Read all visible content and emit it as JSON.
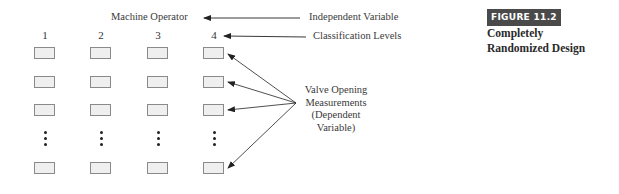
{
  "figure": {
    "badge": "FIGURE 11.2",
    "title_line1": "Completely",
    "title_line2": "Randomized Design"
  },
  "diagram": {
    "factor_label": "Machine Operator",
    "independent_variable_label": "Independent Variable",
    "classification_levels_label": "Classification Levels",
    "levels": [
      "1",
      "2",
      "3",
      "4"
    ],
    "dependent_variable_label": {
      "line1": "Valve Opening",
      "line2": "Measurements",
      "line3": "(Dependent",
      "line4": "Variable)"
    },
    "rows_visible": 4,
    "ellipsis": "vertical-dots"
  },
  "colors": {
    "box_fill": "#efefef",
    "box_border": "#8a8a8a",
    "badge_bg": "#4a4a4a",
    "text": "#3a3a3a"
  }
}
